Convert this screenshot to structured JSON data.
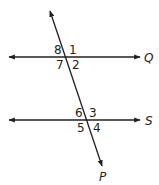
{
  "diagram": {
    "colors": {
      "line": "#231f20",
      "background": "#ffffff"
    },
    "lines": [
      {
        "id": "Q",
        "label": "Q",
        "type": "horizontal",
        "y": 57
      },
      {
        "id": "S",
        "label": "S",
        "type": "horizontal",
        "y": 120
      },
      {
        "id": "P",
        "label": "P",
        "type": "transversal"
      }
    ],
    "angles_at_Q": {
      "top_left": "8",
      "top_right": "1",
      "bottom_left": "7",
      "bottom_right": "2"
    },
    "angles_at_S": {
      "top_left": "6",
      "top_right": "3",
      "bottom_left": "5",
      "bottom_right": "4"
    }
  }
}
